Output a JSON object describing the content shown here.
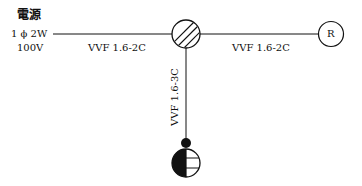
{
  "source": {
    "title": "電源",
    "phase": "1 ϕ 2W",
    "voltage": "100V"
  },
  "cables": {
    "left": "VVF 1.6-2C",
    "right": "VVF 1.6-2C",
    "down": "VVF 1.6-3C"
  },
  "symbols": {
    "junction_box": "joint-box-icon",
    "receptacle": "R",
    "switch_outlet": "switch-receptacle-icon"
  },
  "colors": {
    "stroke": "#111111",
    "background": "#ffffff"
  }
}
